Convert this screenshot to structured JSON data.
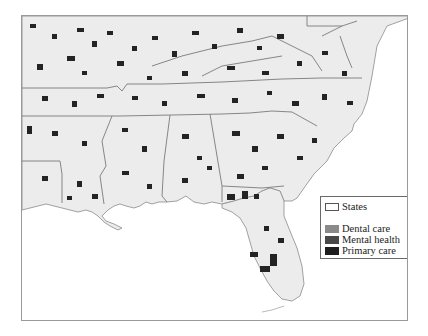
{
  "map": {
    "region": "Southeastern United States",
    "land_color": "#ececec",
    "water_color": "#ffffff",
    "boundary_color": "#7a7a7a",
    "shortage_area_color": "#2a2a2a"
  },
  "legend": {
    "items": [
      {
        "label": "States",
        "color": "#ffffff",
        "type": "outline"
      },
      {
        "label": "Dental care",
        "color": "#8a8a8a",
        "type": "fill"
      },
      {
        "label": "Mental health",
        "color": "#484848",
        "type": "fill"
      },
      {
        "label": "Primary care",
        "color": "#1e1e1e",
        "type": "fill"
      }
    ]
  }
}
